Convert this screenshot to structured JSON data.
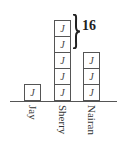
{
  "diagram": {
    "type": "unit-block bar diagram",
    "unit_symbol": "J",
    "columns": [
      {
        "name": "Jay",
        "blocks": 1
      },
      {
        "name": "Sherry",
        "blocks": 5
      },
      {
        "name": "Nairan",
        "blocks": 3
      }
    ],
    "brace": {
      "target": "Sherry",
      "spans_blocks": 2,
      "position": "top",
      "value": "16"
    }
  }
}
